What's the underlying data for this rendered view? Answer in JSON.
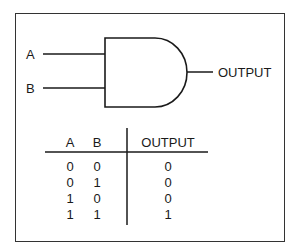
{
  "diagram": {
    "type": "AND gate with truth table",
    "inputs": [
      {
        "label": "A"
      },
      {
        "label": "B"
      }
    ],
    "output": {
      "label": "OUTPUT"
    }
  },
  "truth_table": {
    "headers": [
      "A",
      "B",
      "OUTPUT"
    ],
    "rows": [
      [
        "0",
        "0",
        "0"
      ],
      [
        "0",
        "1",
        "0"
      ],
      [
        "1",
        "0",
        "0"
      ],
      [
        "1",
        "1",
        "1"
      ]
    ]
  },
  "colors": {
    "line": "#1a1a1a",
    "frame": "#333333",
    "background": "#ffffff"
  }
}
